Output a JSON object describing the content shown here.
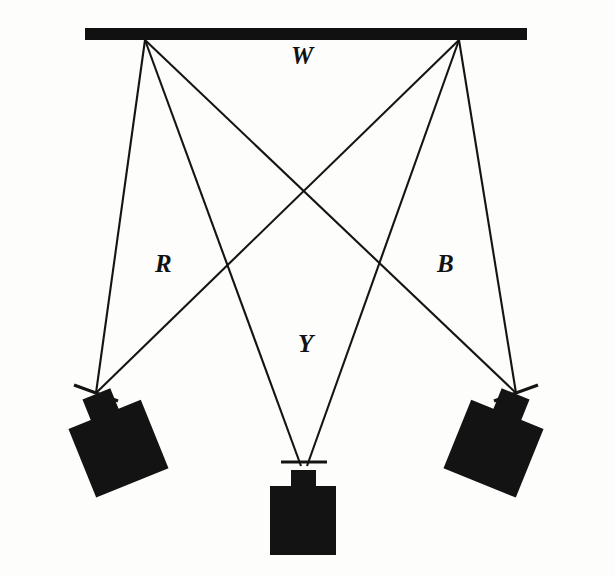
{
  "figure": {
    "title": "",
    "background_color": "#fdfdfb",
    "ink_color": "#131313",
    "width": 615,
    "height": 576
  },
  "labels": {
    "screen": "W",
    "left_camera": "R",
    "center_camera": "Y",
    "right_camera": "B"
  },
  "diagram_data": {
    "type": "optical-ray-diagram",
    "description": "Three projectors aimed at a single wide screen; rays from two screen points converge on each projector lens.",
    "screen": {
      "name": "screen-bar",
      "label": "W",
      "x1": 85,
      "x2": 527,
      "y": 28,
      "thickness": 12
    },
    "screen_points": [
      {
        "name": "left-screen-point",
        "x": 145,
        "y": 40
      },
      {
        "name": "right-screen-point",
        "x": 459,
        "y": 40
      }
    ],
    "cameras": [
      {
        "name": "left-camera",
        "label": "R",
        "lens_x": 96,
        "lens_y": 393,
        "rotation_deg": -22,
        "body_width": 78,
        "body_height": 74,
        "stub_width": 30,
        "stub_height": 22
      },
      {
        "name": "center-camera",
        "label": "Y",
        "lens_x": 303,
        "lens_y": 462,
        "rotation_deg": 0,
        "body_width": 66,
        "body_height": 70,
        "stub_width": 25,
        "stub_height": 18
      },
      {
        "name": "right-camera",
        "label": "B",
        "lens_x": 516,
        "lens_y": 393,
        "rotation_deg": 22,
        "body_width": 78,
        "body_height": 74,
        "stub_width": 30,
        "stub_height": 22
      }
    ],
    "rays": [
      {
        "name": "ray-left-to-left",
        "from": "left-screen-point",
        "to": "left-camera",
        "x1": 145,
        "y1": 40,
        "x2": 96,
        "y2": 393
      },
      {
        "name": "ray-left-to-center",
        "from": "left-screen-point",
        "to": "center-camera",
        "x1": 145,
        "y1": 40,
        "x2": 303,
        "y2": 462
      },
      {
        "name": "ray-left-to-right",
        "from": "left-screen-point",
        "to": "right-camera",
        "x1": 145,
        "y1": 40,
        "x2": 516,
        "y2": 393
      },
      {
        "name": "ray-right-to-left",
        "from": "right-screen-point",
        "to": "left-camera",
        "x1": 459,
        "y1": 40,
        "x2": 96,
        "y2": 393
      },
      {
        "name": "ray-right-to-center",
        "from": "right-screen-point",
        "to": "center-camera",
        "x1": 459,
        "y1": 40,
        "x2": 303,
        "y2": 462
      },
      {
        "name": "ray-right-to-right",
        "from": "right-screen-point",
        "to": "right-camera",
        "x1": 459,
        "y1": 40,
        "x2": 516,
        "y2": 393
      }
    ],
    "crossings": [
      {
        "name": "central-x-crossing",
        "x": 307,
        "y": 200
      },
      {
        "name": "left-crossing",
        "x": 229,
        "y": 277
      },
      {
        "name": "right-crossing",
        "x": 381,
        "y": 277
      }
    ],
    "crosshairs": [
      {
        "name": "left-lens-crosshair",
        "cx": 96,
        "cy": 393,
        "length": 46,
        "angle_deg": 20
      },
      {
        "name": "center-lens-crosshair",
        "cx": 303,
        "cy": 462,
        "length": 46,
        "angle_deg": 0
      },
      {
        "name": "right-lens-crosshair",
        "cx": 516,
        "cy": 393,
        "length": 46,
        "angle_deg": -20
      }
    ]
  }
}
